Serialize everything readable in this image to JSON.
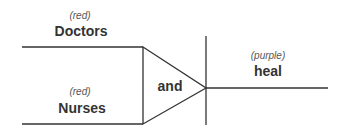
{
  "diagram": {
    "inputs": [
      {
        "tag": "(red)",
        "word": "Doctors"
      },
      {
        "tag": "(red)",
        "word": "Nurses"
      }
    ],
    "gate": {
      "label": "and"
    },
    "output": {
      "tag": "(purple)",
      "word": "heal"
    }
  },
  "colors": {
    "line": "#333333",
    "text": "#333333"
  }
}
